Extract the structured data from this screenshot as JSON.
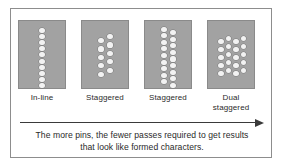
{
  "figure": {
    "panels": [
      {
        "label": "In-line",
        "arrangement": "single-column",
        "columns": [
          {
            "x": 23,
            "y_start": 6.5,
            "count": 10,
            "spacing": 6.2
          }
        ]
      },
      {
        "label": "Staggered",
        "arrangement": "two-column-staggered",
        "columns": [
          {
            "x": 19,
            "y_start": 17,
            "count": 5,
            "spacing": 8.4
          },
          {
            "x": 28,
            "y_start": 13,
            "count": 5,
            "spacing": 8.4
          }
        ]
      },
      {
        "label": "Staggered",
        "arrangement": "two-column-staggered-full",
        "columns": [
          {
            "x": 19,
            "y_start": 5.5,
            "count": 9,
            "spacing": 6.6
          },
          {
            "x": 28,
            "y_start": 9,
            "count": 9,
            "spacing": 6.6
          }
        ]
      },
      {
        "label": "Dual staggered",
        "arrangement": "four-column-dual-staggered",
        "columns": [
          {
            "x": 13,
            "y_start": 18,
            "count": 5,
            "spacing": 8.0
          },
          {
            "x": 20.5,
            "y_start": 14.5,
            "count": 5,
            "spacing": 8.0
          },
          {
            "x": 28,
            "y_start": 18,
            "count": 5,
            "spacing": 8.0
          },
          {
            "x": 35.5,
            "y_start": 14.5,
            "count": 5,
            "spacing": 8.0
          }
        ]
      }
    ],
    "arrow": {
      "direction": "right",
      "meaning": "increasing number of pins"
    },
    "caption": {
      "line1": "The more pins, the fewer passes required to get results",
      "line2": "that  look  like formed characters."
    },
    "colors": {
      "panel_fill": "#a2a2a2",
      "pin_fill": "#f2f2f2",
      "frame_border": "#8d8d8d",
      "text": "#2a2a2a",
      "arrow": "#3a3a3a"
    }
  }
}
